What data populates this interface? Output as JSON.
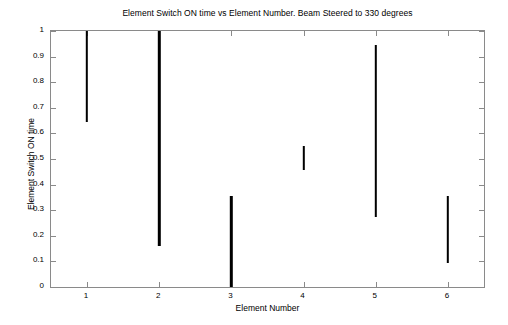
{
  "chart_data": {
    "type": "bar",
    "title": "Element Switch ON time vs Element Number. Beam Steered to 330 degrees",
    "xlabel": "Element Number",
    "ylabel": "Element Switch ON time",
    "grid": false,
    "legend": null,
    "xlim": [
      0.5,
      6.5
    ],
    "ylim": [
      0,
      1
    ],
    "xticks": [
      1,
      2,
      3,
      4,
      5,
      6
    ],
    "xtick_labels": [
      "1",
      "2",
      "3",
      "4",
      "5",
      "6"
    ],
    "yticks": [
      0,
      0.1,
      0.2,
      0.3,
      0.4,
      0.5,
      0.6,
      0.7,
      0.8,
      0.9,
      1
    ],
    "ytick_labels": [
      "0",
      "0.1",
      "0.2",
      "0.3",
      "0.4",
      "0.5",
      "0.6",
      "0.7",
      "0.8",
      "0.9",
      "1"
    ],
    "bar_color": "#000000",
    "axis_color": "#8a8a8a",
    "note": "Each element is drawn as a vertical segment spanning its switch-ON interval [y_low, y_high].",
    "categories": [
      "1",
      "2",
      "3",
      "4",
      "5",
      "6"
    ],
    "segments": [
      {
        "element": 1,
        "y_low": 0.643,
        "y_high": 1.0
      },
      {
        "element": 2,
        "y_low": 0.159,
        "y_high": 1.0
      },
      {
        "element": 3,
        "y_low": 0.0,
        "y_high": 0.356
      },
      {
        "element": 4,
        "y_low": 0.457,
        "y_high": 0.551
      },
      {
        "element": 5,
        "y_low": 0.275,
        "y_high": 0.945
      },
      {
        "element": 6,
        "y_low": 0.093,
        "y_high": 0.356
      }
    ],
    "values": [
      0.357,
      0.841,
      0.356,
      0.094,
      0.67,
      0.263
    ]
  }
}
